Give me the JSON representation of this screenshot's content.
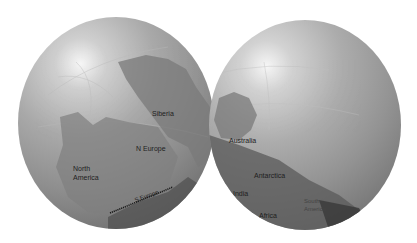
{
  "figure": {
    "globes": [
      {
        "id": "left",
        "labels": {
          "siberia": "Siberia",
          "n_europe": "N Europe",
          "north_america_1": "North",
          "north_america_2": "America",
          "s_europe": "S Europe"
        }
      },
      {
        "id": "right",
        "labels": {
          "australia": "Australia",
          "antarctica": "Antarctica",
          "india": "India",
          "africa": "Africa",
          "south_america_1": "South",
          "south_america_2": "America"
        }
      }
    ],
    "colors": {
      "ocean_light": "#cfcfcf",
      "ocean_dark": "#6e6e6e",
      "land": "#7d7d7d",
      "text": "#1e1e1e"
    }
  }
}
